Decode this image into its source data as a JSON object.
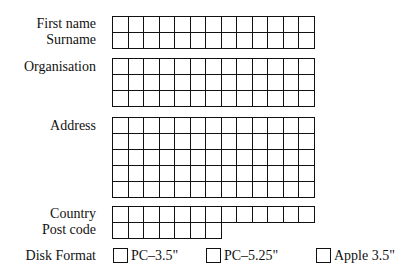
{
  "form": {
    "fields": [
      {
        "id": "first_name",
        "label": "First name",
        "cells": 13,
        "rows": 1
      },
      {
        "id": "surname",
        "label": "Surname",
        "cells": 13,
        "rows": 1
      },
      {
        "id": "organisation",
        "label": "Organisation",
        "cells": 13,
        "rows": 3
      },
      {
        "id": "address",
        "label": "Address",
        "cells": 13,
        "rows": 5
      },
      {
        "id": "country",
        "label": "Country",
        "cells": 13,
        "rows": 1
      },
      {
        "id": "post_code",
        "label": "Post code",
        "cells": 7,
        "rows": 1
      }
    ],
    "disk_format": {
      "label": "Disk Format",
      "options": [
        {
          "label": "PC–3.5\"",
          "checked": false
        },
        {
          "label": "PC–5.25\"",
          "checked": false
        },
        {
          "label": "Apple 3.5\"",
          "checked": false
        }
      ]
    }
  }
}
